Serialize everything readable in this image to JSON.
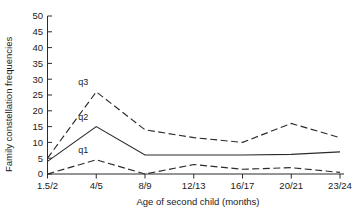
{
  "chart_data": {
    "type": "line",
    "title": "",
    "subtitle": "",
    "xlabel": "Age of second child (months)",
    "ylabel": "Family constellation frequencies",
    "categories": [
      "1.5/2",
      "4/5",
      "8/9",
      "12/13",
      "16/17",
      "20/21",
      "23/24"
    ],
    "xtick_labels": [
      "1.5/2",
      "4/5",
      "8/9",
      "12/13",
      "16/17",
      "20/21",
      "23/24"
    ],
    "ytick_labels": [
      "0",
      "5",
      "10",
      "15",
      "20",
      "25",
      "30",
      "35",
      "40",
      "45",
      "50"
    ],
    "ytick_values": [
      0,
      5,
      10,
      15,
      20,
      25,
      30,
      35,
      40,
      45,
      50
    ],
    "ylim": [
      0,
      50
    ],
    "xlim": [
      0,
      6
    ],
    "grid": false,
    "legend": "inline-labels",
    "series": [
      {
        "name": "q3",
        "label": "q3",
        "linestyle": "dashed",
        "color": "#2b2b2b",
        "values": [
          5,
          26,
          14,
          11.5,
          10,
          16,
          11.5
        ]
      },
      {
        "name": "q2",
        "label": "q2",
        "linestyle": "solid",
        "color": "#2b2b2b",
        "values": [
          4,
          15,
          6,
          6,
          6,
          6.2,
          7
        ]
      },
      {
        "name": "q1",
        "label": "q1",
        "linestyle": "dashed",
        "color": "#2b2b2b",
        "values": [
          0,
          4.5,
          0,
          3,
          1.5,
          2,
          0.5
        ]
      }
    ],
    "annotations": [
      {
        "text": "q3",
        "series": "q3",
        "x_category": "4/5",
        "value": 26
      },
      {
        "text": "q2",
        "series": "q2",
        "x_category": "4/5",
        "value": 15
      },
      {
        "text": "q1",
        "series": "q1",
        "x_category": "4/5",
        "value": 4.5
      }
    ]
  }
}
